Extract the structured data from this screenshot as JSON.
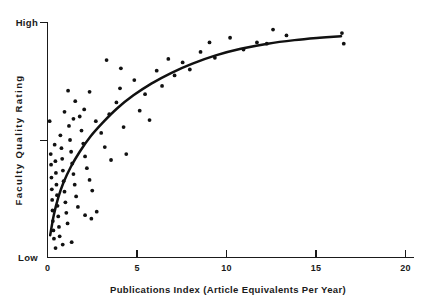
{
  "chart_data": {
    "type": "scatter",
    "title": "",
    "subtitle": "",
    "xlabel": "Publications Index (Article Equivalents Per Year)",
    "ylabel": "Faculty Quality Rating",
    "xlim": [
      0,
      20
    ],
    "ylim": [
      0,
      100
    ],
    "grid": false,
    "legend": null,
    "x_ticks": [
      {
        "value": 0,
        "label": "0"
      },
      {
        "value": 5,
        "label": "5"
      },
      {
        "value": 10,
        "label": "10"
      },
      {
        "value": 15,
        "label": "15"
      },
      {
        "value": 20,
        "label": "20"
      }
    ],
    "y_ticks": [
      {
        "value": 100,
        "label": "High"
      },
      {
        "value": 50,
        "label": ""
      },
      {
        "value": 0,
        "label": "Low"
      }
    ],
    "y_axis_low_label": "Low",
    "y_axis_high_label": "High",
    "annotations": [],
    "fit_curve": {
      "name": "fitted regression curve",
      "description": "concave increasing curve approaching asymptote near High",
      "points": [
        [
          0.15,
          9.5
        ],
        [
          0.35,
          18.0
        ],
        [
          0.6,
          25.5
        ],
        [
          0.9,
          32.0
        ],
        [
          1.3,
          38.5
        ],
        [
          1.8,
          45.0
        ],
        [
          2.4,
          51.5
        ],
        [
          3.1,
          57.5
        ],
        [
          3.9,
          63.5
        ],
        [
          4.8,
          69.0
        ],
        [
          5.8,
          74.0
        ],
        [
          6.9,
          78.5
        ],
        [
          8.1,
          82.5
        ],
        [
          9.4,
          86.0
        ],
        [
          10.8,
          88.8
        ],
        [
          12.3,
          91.0
        ],
        [
          13.8,
          92.5
        ],
        [
          15.2,
          93.5
        ],
        [
          16.4,
          94.2
        ]
      ]
    },
    "points": [
      [
        0.12,
        58.0
      ],
      [
        0.18,
        44.0
      ],
      [
        0.2,
        39.5
      ],
      [
        0.22,
        34.0
      ],
      [
        0.24,
        29.0
      ],
      [
        0.26,
        24.5
      ],
      [
        0.28,
        20.0
      ],
      [
        0.3,
        15.5
      ],
      [
        0.33,
        11.5
      ],
      [
        0.36,
        8.0
      ],
      [
        0.4,
        48.0
      ],
      [
        0.44,
        41.0
      ],
      [
        0.47,
        36.0
      ],
      [
        0.5,
        31.0
      ],
      [
        0.53,
        26.5
      ],
      [
        0.56,
        22.0
      ],
      [
        0.6,
        17.5
      ],
      [
        0.64,
        13.0
      ],
      [
        0.68,
        9.0
      ],
      [
        0.72,
        52.0
      ],
      [
        0.78,
        46.5
      ],
      [
        0.82,
        42.0
      ],
      [
        0.86,
        37.0
      ],
      [
        0.9,
        32.5
      ],
      [
        0.95,
        28.0
      ],
      [
        1.0,
        23.5
      ],
      [
        1.05,
        19.0
      ],
      [
        1.12,
        14.5
      ],
      [
        1.2,
        56.0
      ],
      [
        1.26,
        50.0
      ],
      [
        1.32,
        45.0
      ],
      [
        1.38,
        40.0
      ],
      [
        1.45,
        35.5
      ],
      [
        1.52,
        31.0
      ],
      [
        1.6,
        26.0
      ],
      [
        1.7,
        21.5
      ],
      [
        1.8,
        60.0
      ],
      [
        1.9,
        54.0
      ],
      [
        2.0,
        48.5
      ],
      [
        2.1,
        43.0
      ],
      [
        2.2,
        38.0
      ],
      [
        2.35,
        33.0
      ],
      [
        2.5,
        28.5
      ],
      [
        2.1,
        18.0
      ],
      [
        2.45,
        16.5
      ],
      [
        2.75,
        19.5
      ],
      [
        1.55,
        66.5
      ],
      [
        2.05,
        63.0
      ],
      [
        2.35,
        70.5
      ],
      [
        2.7,
        58.0
      ],
      [
        3.0,
        53.0
      ],
      [
        3.2,
        47.0
      ],
      [
        3.45,
        61.0
      ],
      [
        3.55,
        41.5
      ],
      [
        3.85,
        66.0
      ],
      [
        4.05,
        72.0
      ],
      [
        4.25,
        55.5
      ],
      [
        4.4,
        44.0
      ],
      [
        3.3,
        84.0
      ],
      [
        4.1,
        80.5
      ],
      [
        4.85,
        75.5
      ],
      [
        5.15,
        62.5
      ],
      [
        5.45,
        69.5
      ],
      [
        5.7,
        58.5
      ],
      [
        6.1,
        79.5
      ],
      [
        6.4,
        73.0
      ],
      [
        6.75,
        84.5
      ],
      [
        7.1,
        77.5
      ],
      [
        7.55,
        83.0
      ],
      [
        7.95,
        80.0
      ],
      [
        8.55,
        87.5
      ],
      [
        9.05,
        91.5
      ],
      [
        9.35,
        85.0
      ],
      [
        10.2,
        93.5
      ],
      [
        10.95,
        88.5
      ],
      [
        11.7,
        91.5
      ],
      [
        12.25,
        91.0
      ],
      [
        12.6,
        97.0
      ],
      [
        13.35,
        94.5
      ],
      [
        16.45,
        95.5
      ],
      [
        16.55,
        91.0
      ],
      [
        0.45,
        4.0
      ],
      [
        0.85,
        5.5
      ],
      [
        1.35,
        6.5
      ],
      [
        1.15,
        71.0
      ],
      [
        0.95,
        62.0
      ],
      [
        1.45,
        59.0
      ]
    ]
  },
  "icons": {
    "tick": "tick-mark"
  }
}
